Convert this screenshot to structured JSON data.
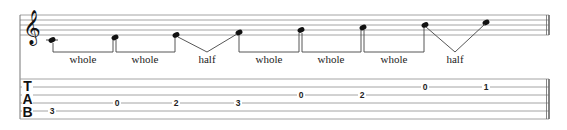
{
  "diagram": {
    "type": "music-notation-with-tablature",
    "clef": "treble",
    "tab_label": [
      "T",
      "A",
      "B"
    ],
    "notes": [
      {
        "pitch": "C4",
        "tab_string": 5,
        "fret": "3"
      },
      {
        "pitch": "D4",
        "tab_string": 4,
        "fret": "0"
      },
      {
        "pitch": "E4",
        "tab_string": 4,
        "fret": "2"
      },
      {
        "pitch": "F4",
        "tab_string": 4,
        "fret": "3"
      },
      {
        "pitch": "G4",
        "tab_string": 3,
        "fret": "0"
      },
      {
        "pitch": "A4",
        "tab_string": 3,
        "fret": "2"
      },
      {
        "pitch": "B4",
        "tab_string": 2,
        "fret": "0"
      },
      {
        "pitch": "C5",
        "tab_string": 2,
        "fret": "1"
      }
    ],
    "intervals": [
      {
        "label": "whole",
        "kind": "bracket"
      },
      {
        "label": "whole",
        "kind": "bracket"
      },
      {
        "label": "half",
        "kind": "v"
      },
      {
        "label": "whole",
        "kind": "bracket"
      },
      {
        "label": "whole",
        "kind": "bracket"
      },
      {
        "label": "whole",
        "kind": "bracket"
      },
      {
        "label": "half",
        "kind": "v"
      }
    ],
    "colors": {
      "ink": "#222222",
      "staff_line": "#999999",
      "background": "#ffffff"
    }
  }
}
